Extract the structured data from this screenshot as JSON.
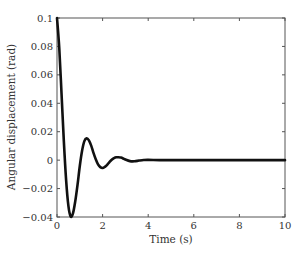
{
  "chart_data": {
    "type": "line",
    "title": "",
    "xlabel": "Time (s)",
    "ylabel": "Angular displacement (rad)",
    "xlim": [
      0,
      10
    ],
    "ylim": [
      -0.04,
      0.1
    ],
    "xticks": [
      0,
      2,
      4,
      6,
      8,
      10
    ],
    "xtick_labels": [
      "0",
      "2",
      "4",
      "6",
      "8",
      "10"
    ],
    "yticks": [
      -0.04,
      -0.02,
      0,
      0.02,
      0.04,
      0.06,
      0.08,
      0.1
    ],
    "ytick_labels": [
      "-0.04",
      "-0.02",
      "0",
      "0.02",
      "0.04",
      "0.06",
      "0.08",
      "0.1"
    ],
    "grid": false,
    "legend": null,
    "series": [
      {
        "name": "angular displacement",
        "color": "#111111",
        "x": [
          0,
          0.1,
          0.2,
          0.3,
          0.4,
          0.5,
          0.6,
          0.7,
          0.8,
          0.9,
          1.0,
          1.1,
          1.2,
          1.3,
          1.4,
          1.5,
          1.6,
          1.7,
          1.8,
          1.9,
          2.0,
          2.1,
          2.2,
          2.3,
          2.4,
          2.5,
          2.6,
          2.7,
          2.8,
          2.9,
          3.0,
          3.2,
          3.4,
          3.6,
          3.8,
          4.0,
          4.5,
          5,
          6,
          7,
          8,
          9,
          10
        ],
        "y": [
          0.1,
          0.0787,
          0.0464,
          0.0134,
          -0.014,
          -0.0322,
          -0.0397,
          -0.0375,
          -0.029,
          -0.0174,
          -0.0041,
          0.0066,
          0.0134,
          0.0153,
          0.0139,
          0.0102,
          0.0051,
          0.0006,
          -0.003,
          -0.0049,
          -0.0055,
          -0.0047,
          -0.0033,
          -0.0014,
          0.0003,
          0.0014,
          0.002,
          0.002,
          0.0018,
          0.0012,
          0.0004,
          -0.0007,
          -0.0008,
          -0.0003,
          0.0001,
          0.0002,
          0.0,
          0.0,
          0.0,
          0.0,
          0.0,
          0.0,
          0.0
        ]
      }
    ]
  }
}
